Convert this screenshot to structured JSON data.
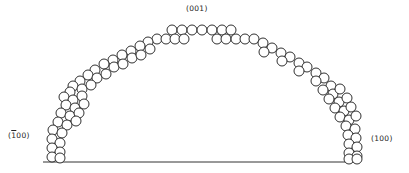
{
  "diagram": {
    "type": "crystal-facet-cross-section",
    "labels": {
      "top": "(001)",
      "left_open": "(",
      "left_bar": "1",
      "left_rest": "00)",
      "right": "(100)"
    },
    "stroke_color": "#1a1a1a",
    "fill_color": "#ffffff",
    "atom_radius": 5,
    "baseline": {
      "x1": 43,
      "x2": 358,
      "y": 162
    },
    "atoms": [
      [
        172,
        30
      ],
      [
        182,
        30
      ],
      [
        192,
        30
      ],
      [
        202,
        30
      ],
      [
        212,
        30
      ],
      [
        222,
        30
      ],
      [
        231,
        30
      ],
      [
        157,
        39
      ],
      [
        166,
        39
      ],
      [
        175,
        39
      ],
      [
        184,
        39
      ],
      [
        217,
        39
      ],
      [
        226,
        39
      ],
      [
        236,
        39
      ],
      [
        245,
        39
      ],
      [
        254,
        39
      ],
      [
        148,
        42
      ],
      [
        140,
        46
      ],
      [
        150,
        49
      ],
      [
        131,
        51
      ],
      [
        122,
        55
      ],
      [
        132,
        58
      ],
      [
        141,
        55
      ],
      [
        113,
        60
      ],
      [
        104,
        64
      ],
      [
        114,
        67
      ],
      [
        123,
        64
      ],
      [
        95,
        70
      ],
      [
        88,
        75
      ],
      [
        97,
        78
      ],
      [
        106,
        74
      ],
      [
        80,
        81
      ],
      [
        73,
        86
      ],
      [
        82,
        89
      ],
      [
        91,
        85
      ],
      [
        70,
        92
      ],
      [
        64,
        97
      ],
      [
        73,
        100
      ],
      [
        82,
        96
      ],
      [
        66,
        105
      ],
      [
        75,
        108
      ],
      [
        84,
        104
      ],
      [
        61,
        113
      ],
      [
        70,
        116
      ],
      [
        79,
        113
      ],
      [
        58,
        122
      ],
      [
        67,
        125
      ],
      [
        76,
        121
      ],
      [
        53,
        130
      ],
      [
        62,
        133
      ],
      [
        52,
        139
      ],
      [
        60,
        143
      ],
      [
        52,
        148
      ],
      [
        60,
        152
      ],
      [
        52,
        157
      ],
      [
        60,
        158
      ],
      [
        263,
        43
      ],
      [
        272,
        48
      ],
      [
        264,
        52
      ],
      [
        281,
        53
      ],
      [
        290,
        57
      ],
      [
        282,
        61
      ],
      [
        299,
        63
      ],
      [
        307,
        67
      ],
      [
        299,
        71
      ],
      [
        316,
        73
      ],
      [
        324,
        78
      ],
      [
        316,
        81
      ],
      [
        331,
        86
      ],
      [
        323,
        90
      ],
      [
        333,
        94
      ],
      [
        340,
        89
      ],
      [
        329,
        99
      ],
      [
        339,
        102
      ],
      [
        347,
        98
      ],
      [
        335,
        108
      ],
      [
        344,
        111
      ],
      [
        351,
        107
      ],
      [
        340,
        117
      ],
      [
        349,
        120
      ],
      [
        356,
        116
      ],
      [
        346,
        126
      ],
      [
        355,
        129
      ],
      [
        348,
        135
      ],
      [
        356,
        138
      ],
      [
        349,
        144
      ],
      [
        357,
        147
      ],
      [
        349,
        153
      ],
      [
        357,
        156
      ],
      [
        349,
        159
      ],
      [
        357,
        159
      ]
    ]
  }
}
